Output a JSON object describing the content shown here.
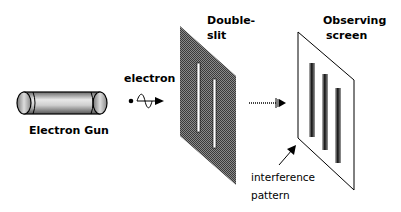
{
  "diagram": {
    "components": {
      "gun": {
        "label": "Electron Gun"
      },
      "particle": {
        "label": "electron"
      },
      "double_slit": {
        "label_line1": "Double-",
        "label_line2": "slit"
      },
      "screen": {
        "label_line1": "Observing",
        "label_line2": "screen"
      },
      "pattern": {
        "label_line1": "interference",
        "label_line2": "pattern"
      }
    },
    "colors": {
      "background": "#ffffff",
      "ink": "#000000",
      "slit_panel": "#6e6e6e",
      "slit_opening": "#ffffff",
      "fringe": "#1a1a1a"
    }
  }
}
